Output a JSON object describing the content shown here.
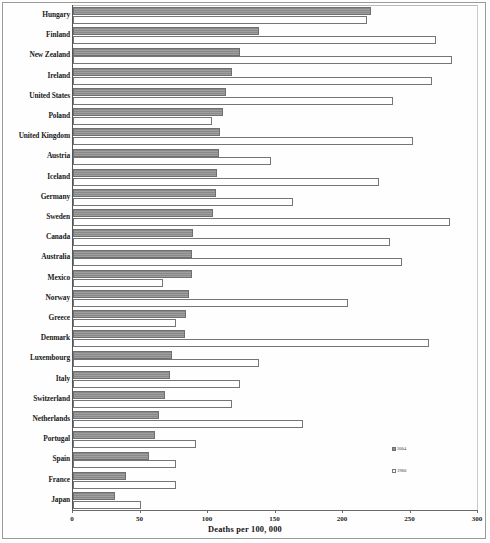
{
  "chart_data": {
    "type": "bar",
    "title": "",
    "orientation": "horizontal",
    "xlabel": "Deaths per 100, 000",
    "ylabel": "",
    "xlim": [
      0,
      300
    ],
    "xticks": [
      0,
      50,
      100,
      150,
      200,
      250,
      300
    ],
    "grid": false,
    "legend_position": "inside-lower-right",
    "categories": [
      "Hungary",
      "Finland",
      "New Zealand",
      "Ireland",
      "United States",
      "Poland",
      "United Kingdom",
      "Austria",
      "Iceland",
      "Germany",
      "Sweden",
      "Canada",
      "Australia",
      "Mexico",
      "Norway",
      "Greece",
      "Denmark",
      "Luxembourg",
      "Italy",
      "Switzerland",
      "Netherlands",
      "Portugal",
      "Spain",
      "France",
      "Japan"
    ],
    "series": [
      {
        "name": "2004",
        "color": "#8d8d8d",
        "values": [
          221,
          138,
          124,
          118,
          113,
          111,
          109,
          108,
          107,
          106,
          104,
          89,
          88,
          88,
          86,
          84,
          83,
          73,
          72,
          68,
          64,
          61,
          56,
          39,
          31
        ]
      },
      {
        "name": "1980",
        "color": "#ffffff",
        "values": [
          218,
          269,
          281,
          266,
          237,
          103,
          252,
          147,
          227,
          163,
          279,
          235,
          244,
          67,
          204,
          76,
          264,
          138,
          124,
          118,
          170,
          91,
          76,
          76,
          50
        ]
      }
    ]
  },
  "legend": {
    "entries": [
      {
        "label": "2004",
        "swatch": "filled-gray-square"
      },
      {
        "label": "1980",
        "swatch": "hollow-white-square"
      }
    ]
  }
}
